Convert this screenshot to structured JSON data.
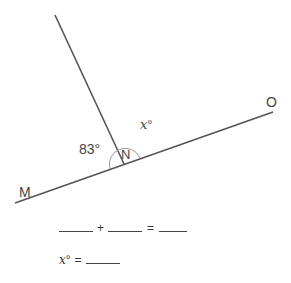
{
  "diagram": {
    "points": {
      "M": {
        "label": "M"
      },
      "N": {
        "label": "N"
      },
      "O": {
        "label": "O"
      }
    },
    "known_angle": "83°",
    "unknown_angle": {
      "var": "x",
      "degree": "°"
    },
    "colors": {
      "line": "#555555",
      "arc": "#999999",
      "text": "#444444"
    }
  },
  "worksheet": {
    "plus": "+",
    "equals": "=",
    "answer_var": "x",
    "answer_degree": "°",
    "answer_equals": "="
  }
}
